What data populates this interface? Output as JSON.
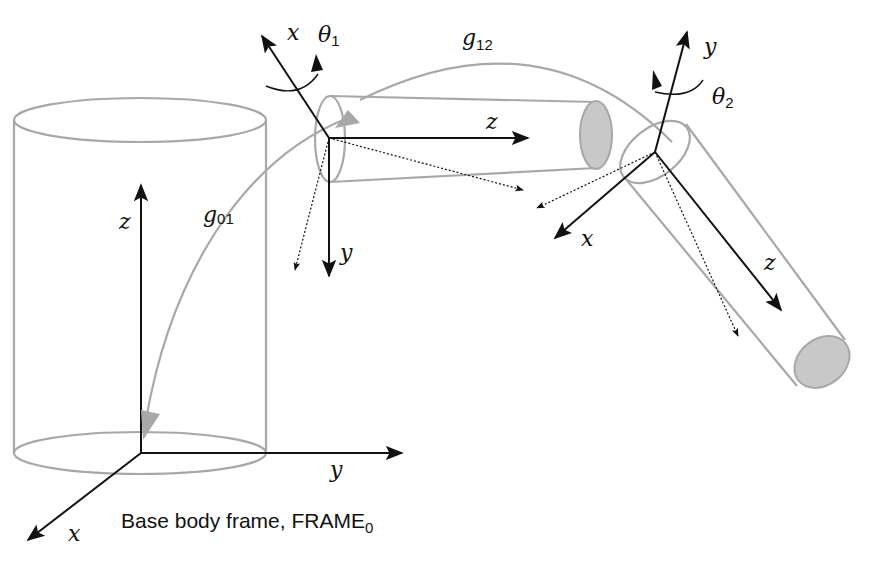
{
  "diagram": {
    "caption": {
      "main": "Base body frame, FRAME",
      "subscript": "0"
    },
    "transforms": {
      "g01": {
        "symbol": "g",
        "subscript": "01"
      },
      "g12": {
        "symbol": "g",
        "subscript": "12"
      }
    },
    "joints": {
      "theta1": {
        "symbol": "θ",
        "subscript": "1"
      },
      "theta2": {
        "symbol": "θ",
        "subscript": "2"
      }
    },
    "base_frame_axes": {
      "z": "z",
      "y": "y",
      "x": "x"
    },
    "frame1_axes": {
      "x": "x",
      "z": "z",
      "y": "y"
    },
    "frame2_axes": {
      "y": "y",
      "x": "x",
      "z": "z"
    },
    "colors": {
      "link_outline": "#a8a8a8",
      "link_end_fill": "#c8c8c8",
      "axis": "#111111",
      "background": "#ffffff"
    }
  }
}
